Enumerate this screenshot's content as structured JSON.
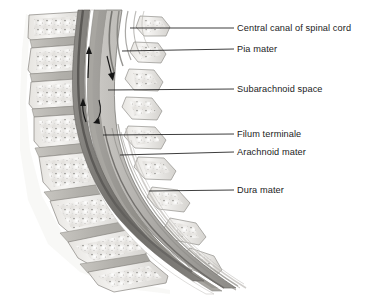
{
  "figure": {
    "background_color": "#ffffff",
    "line_color": "#1b1b1b",
    "text_color": "#1b1b1b"
  },
  "labels": [
    {
      "id": "central-canal",
      "text": "Central canal of spinal cord",
      "text_x": 237,
      "text_y": 23,
      "leader": {
        "x1": 130,
        "y1": 28,
        "x2": 234,
        "y2": 28
      }
    },
    {
      "id": "pia-mater",
      "text": "Pia mater",
      "text_x": 237,
      "text_y": 44,
      "leader": {
        "x1": 122,
        "y1": 51,
        "x2": 234,
        "y2": 49
      }
    },
    {
      "id": "subarachnoid-space",
      "text": "Subarachnoid space",
      "text_x": 237,
      "text_y": 84,
      "leader": {
        "x1": 108,
        "y1": 90,
        "x2": 234,
        "y2": 89
      }
    },
    {
      "id": "filum-terminale",
      "text": "Filum terminale",
      "text_x": 237,
      "text_y": 129,
      "leader": {
        "x1": 103,
        "y1": 135,
        "x2": 234,
        "y2": 134
      }
    },
    {
      "id": "arachnoid-mater",
      "text": "Arachnoid mater",
      "text_x": 237,
      "text_y": 147,
      "leader": {
        "x1": 120,
        "y1": 155,
        "x2": 234,
        "y2": 152
      }
    },
    {
      "id": "dura-mater",
      "text": "Dura mater",
      "text_x": 237,
      "text_y": 185,
      "leader": {
        "x1": 149,
        "y1": 191,
        "x2": 234,
        "y2": 190
      }
    }
  ],
  "flow_arrows": [
    {
      "id": "csf-flow-up-upper",
      "direction": "up",
      "x": 87,
      "y": 60
    },
    {
      "id": "csf-flow-down",
      "direction": "down",
      "x": 110,
      "y": 67
    },
    {
      "id": "csf-flow-up-lower",
      "direction": "up",
      "x": 83,
      "y": 105
    },
    {
      "id": "csf-flow-curve-return",
      "direction": "curve",
      "x": 98,
      "y": 108
    }
  ],
  "anatomy": {
    "vertebrae_count": 10,
    "palette": {
      "bone_light": "#f2f1ef",
      "bone_mid": "#dcdad6",
      "bone_edge": "#9c9a96",
      "disc": "#b9b7b2",
      "cord_dark": "#6f6d6a",
      "cord_mid": "#8e8c88",
      "cord_light": "#bab8b4",
      "dura_white": "#ffffff",
      "outline": "#7a7874"
    }
  }
}
